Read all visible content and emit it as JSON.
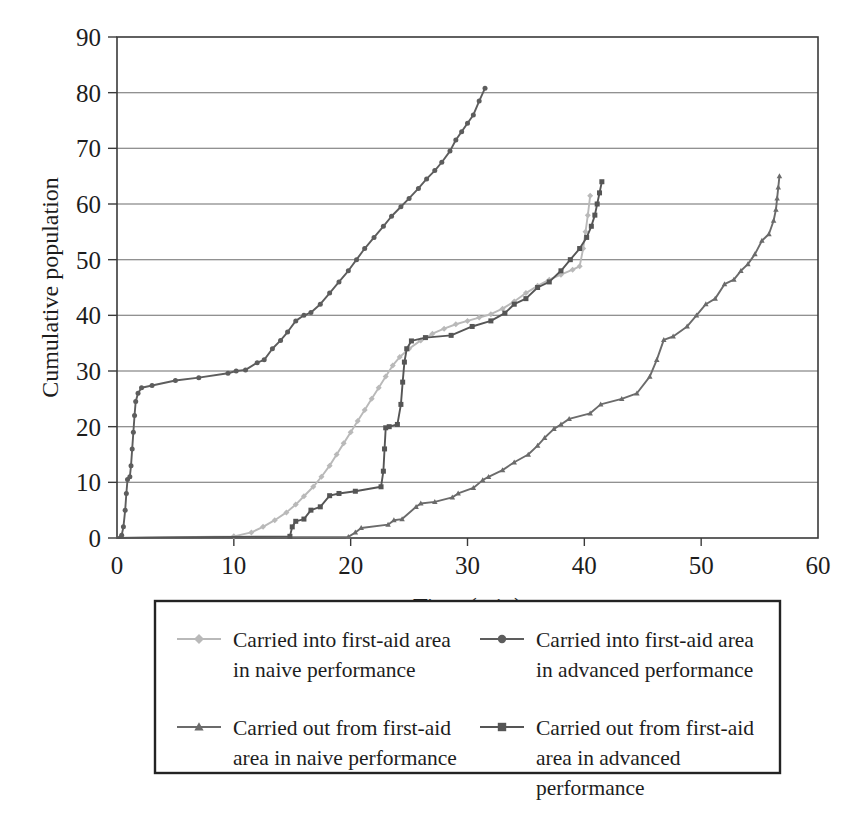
{
  "chart_data": {
    "type": "line",
    "title": "",
    "xlabel": "Time (min)",
    "ylabel": "Cumulative population",
    "xlim": [
      0,
      60
    ],
    "ylim": [
      0,
      90
    ],
    "xticks": [
      0,
      10,
      20,
      30,
      40,
      50,
      60
    ],
    "yticks": [
      0,
      10,
      20,
      30,
      40,
      50,
      60,
      70,
      80,
      90
    ],
    "grid": "horizontal",
    "legend_position": "below-plot",
    "series": [
      {
        "name": "Carried into first-aid area in naive performance",
        "legend_label_lines": [
          "Carried into first-aid area",
          "in naive performance"
        ],
        "marker": "diamond",
        "color": "#b9b9b9",
        "points": [
          [
            0.0,
            0
          ],
          [
            10.0,
            0.3
          ],
          [
            11.5,
            1.0
          ],
          [
            12.5,
            2.0
          ],
          [
            13.5,
            3.2
          ],
          [
            14.5,
            4.6
          ],
          [
            15.3,
            6.0
          ],
          [
            16.0,
            7.5
          ],
          [
            16.8,
            9.2
          ],
          [
            17.5,
            11.0
          ],
          [
            18.2,
            13.0
          ],
          [
            18.8,
            15.0
          ],
          [
            19.4,
            17.0
          ],
          [
            20.0,
            19.0
          ],
          [
            20.6,
            21.0
          ],
          [
            21.2,
            23.0
          ],
          [
            21.8,
            25.0
          ],
          [
            22.4,
            27.0
          ],
          [
            23.0,
            29.0
          ],
          [
            23.6,
            31.0
          ],
          [
            24.2,
            32.5
          ],
          [
            25.0,
            34.0
          ],
          [
            26.0,
            35.5
          ],
          [
            27.0,
            36.7
          ],
          [
            28.0,
            37.6
          ],
          [
            29.0,
            38.4
          ],
          [
            30.0,
            39.0
          ],
          [
            31.0,
            39.6
          ],
          [
            32.0,
            40.2
          ],
          [
            33.0,
            41.2
          ],
          [
            34.0,
            42.5
          ],
          [
            35.0,
            44.0
          ],
          [
            36.0,
            45.3
          ],
          [
            37.0,
            46.4
          ],
          [
            38.0,
            47.3
          ],
          [
            39.0,
            48.2
          ],
          [
            39.6,
            48.8
          ],
          [
            39.9,
            52.0
          ],
          [
            40.1,
            55.0
          ],
          [
            40.3,
            58.0
          ],
          [
            40.5,
            61.5
          ]
        ]
      },
      {
        "name": "Carried into first-aid area in advanced performance",
        "legend_label_lines": [
          "Carried into first-aid area",
          "in advanced performance"
        ],
        "marker": "circle",
        "color": "#5d5d5d",
        "points": [
          [
            0.0,
            0
          ],
          [
            0.4,
            0.5
          ],
          [
            0.55,
            2.0
          ],
          [
            0.7,
            5.0
          ],
          [
            0.8,
            8.0
          ],
          [
            0.9,
            10.5
          ],
          [
            1.1,
            11.0
          ],
          [
            1.2,
            13.0
          ],
          [
            1.3,
            16.0
          ],
          [
            1.4,
            19.0
          ],
          [
            1.5,
            22.0
          ],
          [
            1.6,
            24.5
          ],
          [
            1.8,
            26.0
          ],
          [
            2.1,
            27.0
          ],
          [
            3.0,
            27.4
          ],
          [
            5.0,
            28.3
          ],
          [
            7.0,
            28.8
          ],
          [
            9.5,
            29.6
          ],
          [
            10.2,
            30.0
          ],
          [
            11.0,
            30.2
          ],
          [
            12.0,
            31.5
          ],
          [
            12.6,
            32.0
          ],
          [
            13.3,
            34.0
          ],
          [
            14.0,
            35.5
          ],
          [
            14.6,
            37.0
          ],
          [
            15.3,
            39.0
          ],
          [
            16.0,
            40.0
          ],
          [
            16.6,
            40.5
          ],
          [
            17.4,
            42.0
          ],
          [
            18.2,
            44.0
          ],
          [
            19.0,
            46.0
          ],
          [
            19.8,
            48.0
          ],
          [
            20.5,
            50.0
          ],
          [
            21.2,
            52.0
          ],
          [
            22.0,
            54.0
          ],
          [
            22.8,
            56.0
          ],
          [
            23.5,
            57.8
          ],
          [
            24.3,
            59.5
          ],
          [
            25.0,
            61.0
          ],
          [
            25.8,
            62.8
          ],
          [
            26.5,
            64.5
          ],
          [
            27.2,
            66.0
          ],
          [
            27.8,
            67.5
          ],
          [
            28.5,
            69.5
          ],
          [
            29.0,
            71.5
          ],
          [
            29.5,
            73.0
          ],
          [
            30.0,
            74.5
          ],
          [
            30.5,
            76.0
          ],
          [
            31.0,
            78.5
          ],
          [
            31.5,
            80.8
          ]
        ]
      },
      {
        "name": "Carried out from first-aid area in naive performance",
        "legend_label_lines": [
          "Carried out from first-aid",
          "area in naive performance"
        ],
        "marker": "triangle",
        "color": "#6b6b6b",
        "points": [
          [
            0.0,
            0
          ],
          [
            19.8,
            0.2
          ],
          [
            20.4,
            1.0
          ],
          [
            20.9,
            1.8
          ],
          [
            23.2,
            2.4
          ],
          [
            23.7,
            3.2
          ],
          [
            24.4,
            3.4
          ],
          [
            25.6,
            5.6
          ],
          [
            26.0,
            6.2
          ],
          [
            27.2,
            6.5
          ],
          [
            28.7,
            7.3
          ],
          [
            29.2,
            8.0
          ],
          [
            30.5,
            9.0
          ],
          [
            31.3,
            10.4
          ],
          [
            31.8,
            11.0
          ],
          [
            33.0,
            12.2
          ],
          [
            34.0,
            13.6
          ],
          [
            35.2,
            15.0
          ],
          [
            36.0,
            16.6
          ],
          [
            36.6,
            18.0
          ],
          [
            37.4,
            19.6
          ],
          [
            38.0,
            20.4
          ],
          [
            38.7,
            21.4
          ],
          [
            40.5,
            22.4
          ],
          [
            41.4,
            24.0
          ],
          [
            43.2,
            25.0
          ],
          [
            44.5,
            26.0
          ],
          [
            45.6,
            29.0
          ],
          [
            46.2,
            32.0
          ],
          [
            46.8,
            35.6
          ],
          [
            47.6,
            36.2
          ],
          [
            48.8,
            38.0
          ],
          [
            49.6,
            40.0
          ],
          [
            50.4,
            42.0
          ],
          [
            51.2,
            43.0
          ],
          [
            52.0,
            45.6
          ],
          [
            52.8,
            46.4
          ],
          [
            53.4,
            48.0
          ],
          [
            54.0,
            49.2
          ],
          [
            54.6,
            51.0
          ],
          [
            55.2,
            53.4
          ],
          [
            55.8,
            54.6
          ],
          [
            56.2,
            57.0
          ],
          [
            56.4,
            59.0
          ],
          [
            56.5,
            61.0
          ],
          [
            56.6,
            63.0
          ],
          [
            56.7,
            65.0
          ]
        ]
      },
      {
        "name": "Carried out from first-aid area in advanced performance",
        "legend_label_lines": [
          "Carried out from first-aid",
          "area in advanced",
          "performance"
        ],
        "marker": "square",
        "color": "#555555",
        "points": [
          [
            0.0,
            0
          ],
          [
            14.8,
            0.3
          ],
          [
            15.0,
            2.0
          ],
          [
            15.3,
            3.0
          ],
          [
            16.0,
            3.4
          ],
          [
            16.6,
            5.0
          ],
          [
            17.4,
            5.6
          ],
          [
            18.2,
            7.6
          ],
          [
            19.0,
            8.0
          ],
          [
            20.4,
            8.4
          ],
          [
            22.6,
            9.2
          ],
          [
            22.8,
            12.0
          ],
          [
            22.9,
            16.0
          ],
          [
            23.0,
            19.8
          ],
          [
            23.3,
            20.0
          ],
          [
            24.0,
            20.4
          ],
          [
            24.3,
            24.0
          ],
          [
            24.45,
            28.0
          ],
          [
            24.6,
            31.6
          ],
          [
            24.8,
            34.0
          ],
          [
            25.2,
            35.4
          ],
          [
            26.4,
            36.0
          ],
          [
            28.6,
            36.4
          ],
          [
            30.4,
            38.0
          ],
          [
            32.0,
            39.0
          ],
          [
            33.2,
            40.4
          ],
          [
            34.0,
            42.0
          ],
          [
            35.0,
            43.0
          ],
          [
            36.0,
            45.0
          ],
          [
            37.0,
            46.0
          ],
          [
            38.0,
            48.0
          ],
          [
            38.8,
            50.0
          ],
          [
            39.6,
            52.0
          ],
          [
            40.2,
            54.0
          ],
          [
            40.6,
            56.0
          ],
          [
            40.9,
            58.0
          ],
          [
            41.1,
            60.0
          ],
          [
            41.3,
            62.0
          ],
          [
            41.5,
            64.0
          ]
        ]
      }
    ]
  }
}
